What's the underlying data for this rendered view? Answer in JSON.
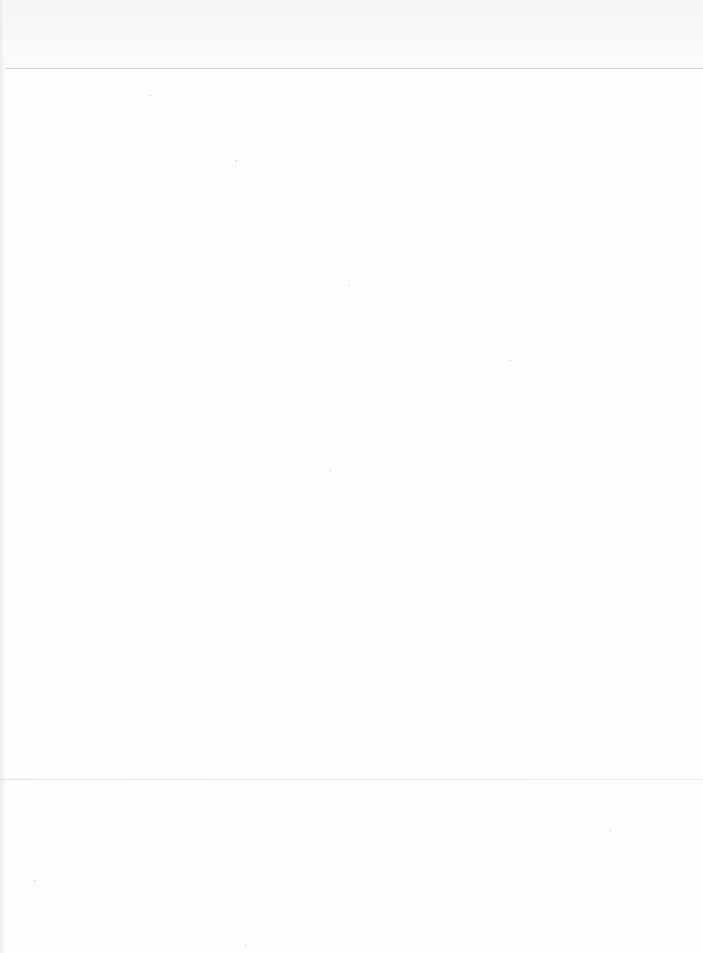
{
  "document": {
    "type": "scanned-page",
    "content": "",
    "header_rule_visible": true,
    "footer_rule_visible": true
  },
  "colors": {
    "paper": "#fefefe",
    "header_band": "#f6f6f6",
    "rule": "#c9c9c9"
  }
}
